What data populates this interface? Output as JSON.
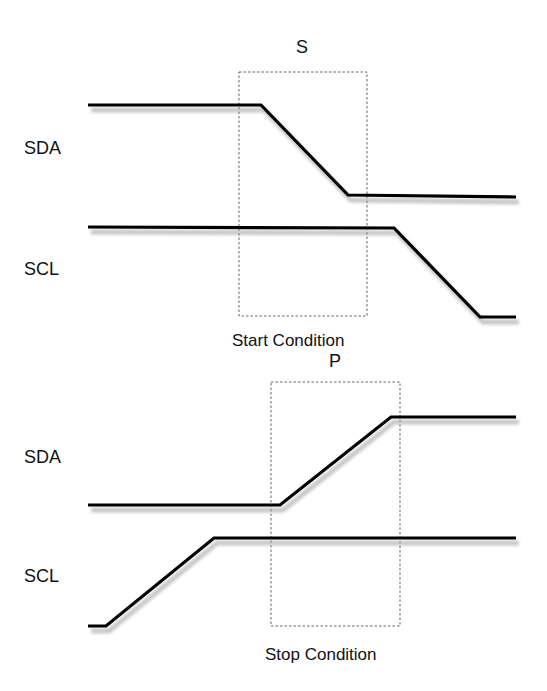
{
  "colors": {
    "trace": "#000000",
    "shadow": "#9a9a9a",
    "box": "#555555",
    "text": "#111111"
  },
  "start": {
    "marker": "S",
    "caption": "Start Condition",
    "sda_label": "SDA",
    "scl_label": "SCL",
    "sda_points": "88,105 261,105 348,195 516,197",
    "scl_points": "88,227 394,228 480,317 516,317",
    "box": {
      "x": 239,
      "y": 72,
      "w": 128,
      "h": 244
    }
  },
  "stop": {
    "marker": "P",
    "caption": "Stop Condition",
    "sda_label": "SDA",
    "scl_label": "SCL",
    "sda_points": "88,505 280,505 391,417 516,417",
    "scl_points": "88,626 106,626 214,538 516,538",
    "box": {
      "x": 271,
      "y": 382,
      "w": 129,
      "h": 244
    }
  }
}
